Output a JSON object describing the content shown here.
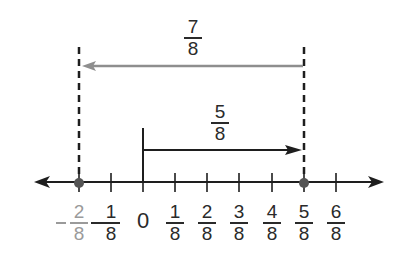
{
  "diagram": {
    "type": "number-line",
    "colors": {
      "axis": "#1e1e1e",
      "point": "#555555",
      "gray_arrow": "#8e8e8e",
      "gray_label": "#9a9a9a",
      "text": "#2a2a2a"
    },
    "arrows": [
      {
        "name": "forward",
        "from": "0",
        "to": "5/8",
        "label": {
          "num": "5",
          "den": "8"
        }
      },
      {
        "name": "backward",
        "from": "5/8",
        "to": "-2/8",
        "label": {
          "num": "7",
          "den": "8"
        }
      }
    ],
    "points": [
      "-2/8",
      "5/8"
    ],
    "ticks": [
      {
        "value": "-2/8",
        "sign": "−",
        "num": "2",
        "den": "8",
        "highlight": true
      },
      {
        "value": "-1/8",
        "sign": "−",
        "num": "1",
        "den": "8"
      },
      {
        "value": "0",
        "text": "0"
      },
      {
        "value": "1/8",
        "num": "1",
        "den": "8"
      },
      {
        "value": "2/8",
        "num": "2",
        "den": "8"
      },
      {
        "value": "3/8",
        "num": "3",
        "den": "8"
      },
      {
        "value": "4/8",
        "num": "4",
        "den": "8"
      },
      {
        "value": "5/8",
        "num": "5",
        "den": "8"
      },
      {
        "value": "6/8",
        "num": "6",
        "den": "8"
      }
    ]
  }
}
